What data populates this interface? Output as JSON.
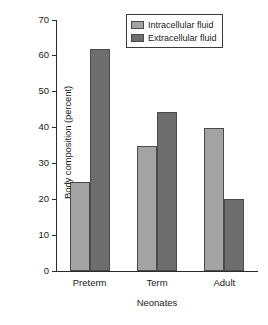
{
  "chart_data": {
    "type": "bar",
    "title": "",
    "xlabel": "Neonates",
    "ylabel": "Body composition (percent)",
    "categories": [
      "Preterm",
      "Term",
      "Adult"
    ],
    "series": [
      {
        "name": "Intracellular fluid",
        "color": "#a3a3a3",
        "values": [
          24.8,
          34.8,
          40.0
        ]
      },
      {
        "name": "Extracellular fluid",
        "color": "#6e6e6e",
        "values": [
          61.8,
          44.3,
          20.0
        ]
      }
    ],
    "ylim": [
      0,
      70
    ],
    "yticks": [
      0,
      10,
      20,
      30,
      40,
      50,
      60,
      70
    ],
    "ytick_labels": [
      "0",
      "10",
      "20",
      "30",
      "40",
      "50",
      "60",
      "70"
    ],
    "grid": false,
    "legend_position": "top-right"
  },
  "axes": {
    "y_title": "Body composition (percent)",
    "x_title": "Neonates"
  },
  "legend": {
    "items": [
      {
        "label": "Intracellular fluid"
      },
      {
        "label": "Extracellular fluid"
      }
    ]
  }
}
